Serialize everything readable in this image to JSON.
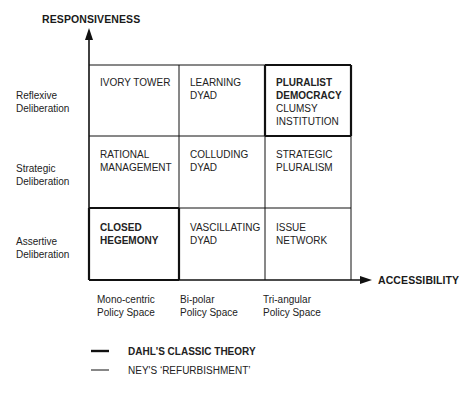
{
  "axes": {
    "y_title": "RESPONSIVENESS",
    "x_title": "ACCESSIBILITY"
  },
  "rows": [
    {
      "line1": "Reflexive",
      "line2": "Deliberation"
    },
    {
      "line1": "Strategic",
      "line2": "Deliberation"
    },
    {
      "line1": "Assertive",
      "line2": "Deliberation"
    }
  ],
  "columns": [
    {
      "line1": "Mono-centric",
      "line2": "Policy Space"
    },
    {
      "line1": "Bi-polar",
      "line2": "Policy Space"
    },
    {
      "line1": "Tri-angular",
      "line2": "Policy Space"
    }
  ],
  "cells": [
    [
      {
        "primary": "IVORY TOWER",
        "primary2": "",
        "secondary": "",
        "secondary2": "",
        "dahl": false
      },
      {
        "primary": "LEARNING",
        "primary2": "DYAD",
        "secondary": "",
        "secondary2": "",
        "dahl": false
      },
      {
        "primary": "PLURALIST",
        "primary2": "DEMOCRACY",
        "secondary": "CLUMSY",
        "secondary2": "INSTITUTION",
        "dahl": true
      }
    ],
    [
      {
        "primary": "RATIONAL",
        "primary2": "MANAGEMENT",
        "secondary": "",
        "secondary2": "",
        "dahl": false
      },
      {
        "primary": "COLLUDING",
        "primary2": "DYAD",
        "secondary": "",
        "secondary2": "",
        "dahl": false
      },
      {
        "primary": "STRATEGIC",
        "primary2": "PLURALISM",
        "secondary": "",
        "secondary2": "",
        "dahl": false
      }
    ],
    [
      {
        "primary": "CLOSED",
        "primary2": "HEGEMONY",
        "secondary": "",
        "secondary2": "",
        "dahl": true
      },
      {
        "primary": "VASCILLATING",
        "primary2": "DYAD",
        "secondary": "",
        "secondary2": "",
        "dahl": false
      },
      {
        "primary": "ISSUE",
        "primary2": "NETWORK",
        "secondary": "",
        "secondary2": "",
        "dahl": false
      }
    ]
  ],
  "legend": [
    {
      "label": "DAHL'S CLASSIC THEORY",
      "line_style": "thick"
    },
    {
      "label": "NEY'S ‘REFURBISHMENT’",
      "line_style": "thin"
    }
  ],
  "colors": {
    "line": "#111111",
    "text": "#222222",
    "background": "#ffffff"
  }
}
